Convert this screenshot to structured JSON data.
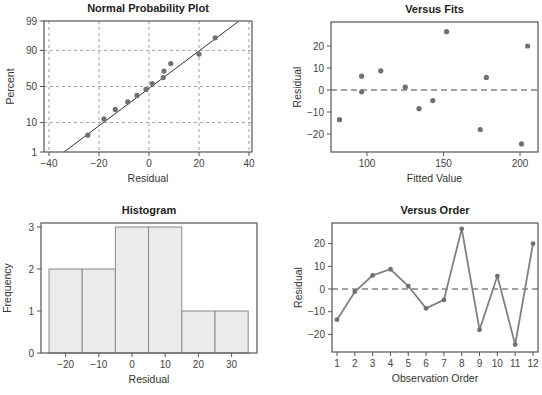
{
  "chart_data": [
    {
      "id": "npp",
      "type": "scatter",
      "title": "Normal Probability Plot",
      "xlabel": "Residual",
      "ylabel": "Percent",
      "xlim": [
        -40,
        40
      ],
      "xticks": [
        -40,
        -20,
        0,
        20,
        40
      ],
      "xtick_labels": [
        "−40",
        "−20",
        "0",
        "20",
        "40"
      ],
      "yticks": [
        1,
        10,
        50,
        90,
        99
      ],
      "yscale": "normal-probability",
      "grid": true,
      "fit_line": {
        "x_at_1pct": -34,
        "x_at_99pct": 36
      },
      "points": [
        {
          "x": -24.5,
          "p": 4.2
        },
        {
          "x": -18,
          "p": 12.5
        },
        {
          "x": -13.5,
          "p": 20.8
        },
        {
          "x": -8.5,
          "p": 29.2
        },
        {
          "x": -4.8,
          "p": 37.5
        },
        {
          "x": -1.2,
          "p": 45.8
        },
        {
          "x": 1.3,
          "p": 54.2
        },
        {
          "x": 5.7,
          "p": 62.5
        },
        {
          "x": 6.0,
          "p": 70.8
        },
        {
          "x": 8.7,
          "p": 79.2
        },
        {
          "x": 20,
          "p": 87.5
        },
        {
          "x": 26.5,
          "p": 95.8
        }
      ]
    },
    {
      "id": "fits",
      "type": "scatter",
      "title": "Versus Fits",
      "xlabel": "Fitted Value",
      "ylabel": "Residual",
      "xlim": [
        72,
        213
      ],
      "ylim": [
        -28,
        30
      ],
      "xticks": [
        100,
        150,
        200
      ],
      "xtick_labels": [
        "100",
        "150",
        "200"
      ],
      "yticks": [
        -20,
        -10,
        0,
        10,
        20
      ],
      "ytick_labels": [
        "−20",
        "−10",
        "0",
        "10",
        "20"
      ],
      "reference_line": 0,
      "points": [
        {
          "x": 82,
          "y": -13.5
        },
        {
          "x": 96.5,
          "y": 6.3
        },
        {
          "x": 96.5,
          "y": -0.8
        },
        {
          "x": 109,
          "y": 8.7
        },
        {
          "x": 125,
          "y": 1.3
        },
        {
          "x": 134,
          "y": -8.5
        },
        {
          "x": 143,
          "y": -4.8
        },
        {
          "x": 152,
          "y": 26.5
        },
        {
          "x": 174,
          "y": -18
        },
        {
          "x": 178,
          "y": 5.7
        },
        {
          "x": 201,
          "y": -24.5
        },
        {
          "x": 205,
          "y": 20
        }
      ]
    },
    {
      "id": "hist",
      "type": "bar",
      "title": "Histogram",
      "xlabel": "Residual",
      "ylabel": "Frequency",
      "xlim": [
        -30,
        37.5
      ],
      "ylim": [
        0,
        3.1
      ],
      "xticks": [
        -20,
        -10,
        0,
        10,
        20,
        30
      ],
      "xtick_labels": [
        "−20",
        "−10",
        "0",
        "10",
        "20",
        "30"
      ],
      "yticks": [
        0,
        1,
        2,
        3
      ],
      "bins": [
        {
          "from": -25,
          "to": -15,
          "count": 2
        },
        {
          "from": -15,
          "to": -5,
          "count": 2
        },
        {
          "from": -5,
          "to": 5,
          "count": 3
        },
        {
          "from": 5,
          "to": 15,
          "count": 3
        },
        {
          "from": 15,
          "to": 25,
          "count": 1
        },
        {
          "from": 25,
          "to": 35,
          "count": 1
        }
      ]
    },
    {
      "id": "order",
      "type": "line",
      "title": "Versus Order",
      "xlabel": "Observation Order",
      "ylabel": "Residual",
      "xlim": [
        0.7,
        12.3
      ],
      "ylim": [
        -28,
        30
      ],
      "xticks": [
        1,
        2,
        3,
        4,
        5,
        6,
        7,
        8,
        9,
        10,
        11,
        12
      ],
      "yticks": [
        -20,
        -10,
        0,
        10,
        20
      ],
      "ytick_labels": [
        "−20",
        "−10",
        "0",
        "10",
        "20"
      ],
      "reference_line": 0,
      "x": [
        1,
        2,
        3,
        4,
        5,
        6,
        7,
        8,
        9,
        10,
        11,
        12
      ],
      "values": [
        -13.5,
        -1.2,
        6.0,
        8.7,
        1.3,
        -8.5,
        -4.8,
        26.5,
        -18,
        5.7,
        -24.5,
        20
      ]
    }
  ],
  "colors": {
    "axis": "#555555",
    "grid": "#888888",
    "point": "#707070",
    "line": "#808080",
    "bar_fill": "#ebebeb",
    "bar_edge": "#8a8a8a",
    "fit_line": "#333333"
  }
}
